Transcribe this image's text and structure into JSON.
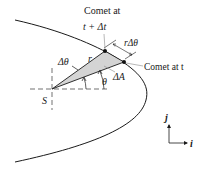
{
  "diagram": {
    "type": "orbital-geometry",
    "labels": {
      "comet_later_line1": "Comet at",
      "comet_later_line2": "t + Δt",
      "comet_now": "Comet at t",
      "arc_length": "rΔθ",
      "delta_theta": "Δθ",
      "radius": "r",
      "theta": "θ",
      "area": "ΔA",
      "sun": "S",
      "unit_j": "j",
      "unit_i": "i"
    },
    "points": {
      "sun": {
        "x": 52,
        "y": 89
      },
      "comet_t_plus_dt": {
        "x": 105,
        "y": 51
      },
      "comet_t": {
        "x": 124,
        "y": 62
      }
    },
    "colors": {
      "line": "#1a1a1a",
      "sector_fill": "#d4d4d4",
      "dash": "#333333",
      "leader": "#888888"
    }
  }
}
